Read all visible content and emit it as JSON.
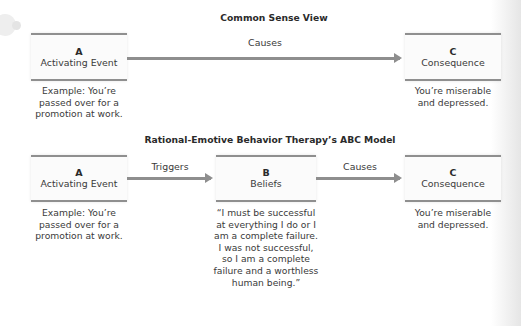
{
  "common_sense_view": {
    "title": "Common Sense View",
    "box_a": {
      "letter": "A",
      "label": "Activating Event"
    },
    "box_a_caption": "Example: You’re passed over for a promotion at work.",
    "arrow_label": "Causes",
    "box_c": {
      "letter": "C",
      "label": "Consequence"
    },
    "box_c_caption": "You’re miserable and depressed."
  },
  "rebt_model": {
    "title": "Rational-Emotive Behavior Therapy’s ABC Model",
    "box_a": {
      "letter": "A",
      "label": "Activating Event"
    },
    "box_a_caption": "Example: You’re passed over for a promotion at work.",
    "arrow_ab_label": "Triggers",
    "box_b": {
      "letter": "B",
      "label": "Beliefs"
    },
    "box_b_caption": "“I must be successful at everything I do or I am a complete failure. I was not successful, so I am a complete failure and a worthless human being.”",
    "arrow_bc_label": "Causes",
    "box_c": {
      "letter": "C",
      "label": "Consequence"
    },
    "box_c_caption": "You’re miserable and depressed."
  },
  "colors": {
    "box_border": "#8f8f8f",
    "arrow": "#8e8e8e",
    "text": "#3a3a3a",
    "title_text": "#2a2a2a"
  }
}
